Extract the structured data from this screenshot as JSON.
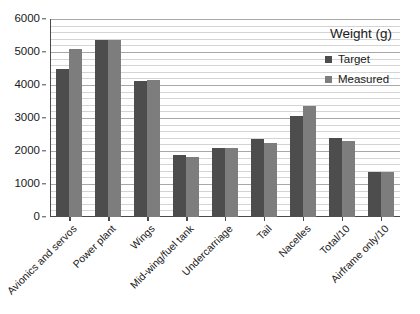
{
  "chart_data": {
    "type": "bar",
    "title": "",
    "xlabel": "",
    "ylabel": "",
    "ylim": [
      0,
      6000
    ],
    "ytick_step": 1000,
    "yticks": [
      0,
      1000,
      2000,
      3000,
      4000,
      5000,
      6000
    ],
    "ytick_labels": [
      "0",
      "1000",
      "2000",
      "3000",
      "4000",
      "5000",
      "6000"
    ],
    "minor_gridlines": true,
    "minor_gridline_step": 200,
    "grid": true,
    "legend_position": "top-right",
    "legend_title": "Weight (g)",
    "categories": [
      "Avionics and servos",
      "Power plant",
      "Wings",
      "Mid-wing/fuel tank",
      "Undercarriage",
      "Tail",
      "Nacelles",
      "Total/10",
      "Airframe only/10"
    ],
    "series": [
      {
        "name": "Target",
        "color": "#4d4d4d",
        "values": [
          4500,
          5350,
          4130,
          1880,
          2100,
          2350,
          3070,
          2400,
          1370
        ]
      },
      {
        "name": "Measured",
        "color": "#7d7d7d",
        "values": [
          5100,
          5350,
          4150,
          1830,
          2100,
          2250,
          3350,
          2300,
          1370
        ]
      }
    ]
  },
  "colors": {
    "background": "#ffffff",
    "axis": "#4a4a4a",
    "grid_major": "#a8a8a8",
    "grid_minor": "#d4d4d4",
    "text": "#1a1a1a"
  }
}
